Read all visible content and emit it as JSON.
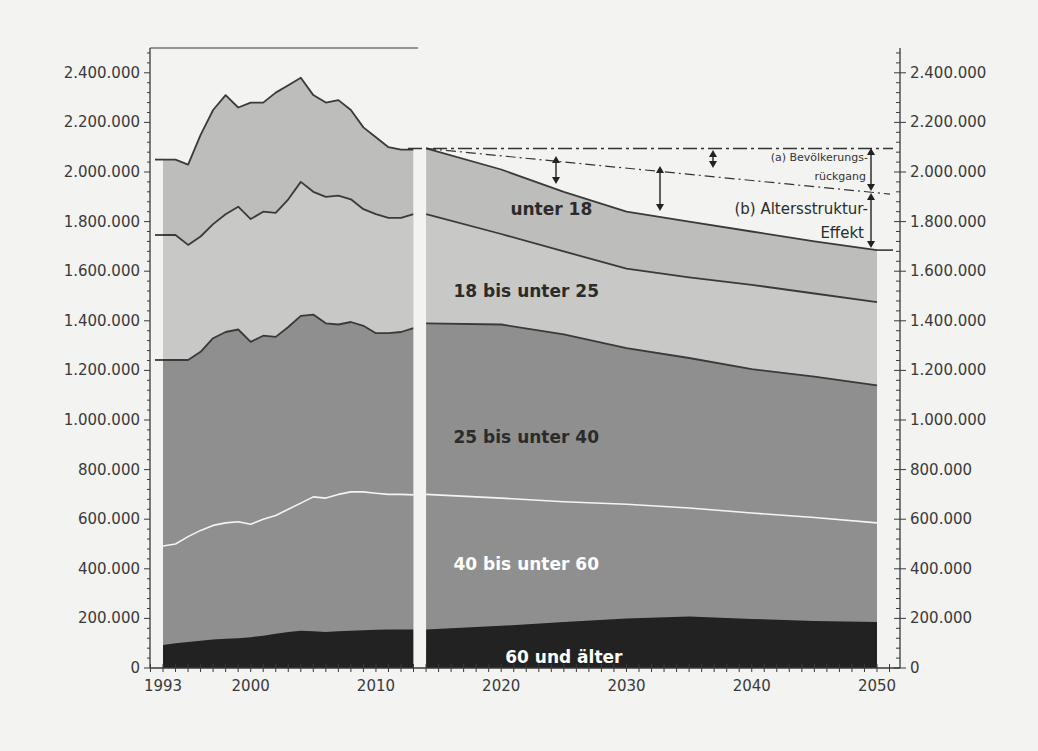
{
  "chart_data": {
    "type": "area",
    "stacked": true,
    "title": "",
    "xlabel": "",
    "ylabel": "",
    "ylim": [
      0,
      2500000
    ],
    "y_ticks": [
      "0",
      "200.000",
      "400.000",
      "600.000",
      "800.000",
      "1.000.000",
      "1.200.000",
      "1.400.000",
      "1.600.000",
      "1.800.000",
      "2.000.000",
      "2.200.000",
      "2.400.000"
    ],
    "y_tick_values": [
      0,
      200000,
      400000,
      600000,
      800000,
      1000000,
      1200000,
      1400000,
      1600000,
      1800000,
      2000000,
      2200000,
      2400000
    ],
    "x_ticks": [
      "1993",
      "2000",
      "2010",
      "2020",
      "2030",
      "2040",
      "2050"
    ],
    "x_tick_values": [
      1993,
      2000,
      2010,
      2020,
      2030,
      2040,
      2050
    ],
    "gap_between": [
      2013,
      2014
    ],
    "grid": false,
    "dual_y_axis": true,
    "series_cumulative_tops": {
      "historical": {
        "x": [
          1993,
          1994,
          1995,
          1996,
          1997,
          1998,
          1999,
          2000,
          2001,
          2002,
          2003,
          2004,
          2005,
          2006,
          2007,
          2008,
          2009,
          2010,
          2011,
          2012,
          2013
        ],
        "total": [
          2050000,
          2050000,
          2030000,
          2150000,
          2250000,
          2310000,
          2260000,
          2280000,
          2280000,
          2320000,
          2350000,
          2380000,
          2310000,
          2280000,
          2290000,
          2250000,
          2180000,
          2140000,
          2100000,
          2090000,
          2090000
        ],
        "age18plus": [
          1746000,
          1746000,
          1706000,
          1740000,
          1790000,
          1830000,
          1860000,
          1810000,
          1840000,
          1835000,
          1890000,
          1960000,
          1920000,
          1900000,
          1905000,
          1890000,
          1850000,
          1830000,
          1815000,
          1815000,
          1830000
        ],
        "age25plus": [
          1242000,
          1242000,
          1242000,
          1275000,
          1330000,
          1355000,
          1365000,
          1315000,
          1340000,
          1335000,
          1375000,
          1420000,
          1425000,
          1390000,
          1385000,
          1395000,
          1380000,
          1350000,
          1350000,
          1355000,
          1370000
        ],
        "age40plus": [
          492000,
          500000,
          530000,
          555000,
          575000,
          585000,
          590000,
          580000,
          600000,
          615000,
          640000,
          665000,
          690000,
          685000,
          700000,
          710000,
          710000,
          705000,
          700000,
          700000,
          698000
        ],
        "age60plus": [
          93000,
          100000,
          105000,
          110000,
          115000,
          118000,
          120000,
          124000,
          130000,
          138000,
          145000,
          150000,
          148000,
          145000,
          148000,
          150000,
          152000,
          154000,
          155000,
          155000,
          155000
        ]
      },
      "projection": {
        "x": [
          2014,
          2020,
          2025,
          2030,
          2035,
          2040,
          2045,
          2050
        ],
        "total": [
          2095000,
          2010000,
          1920000,
          1840000,
          1800000,
          1760000,
          1720000,
          1685000
        ],
        "age18plus": [
          1830000,
          1750000,
          1680000,
          1610000,
          1575000,
          1545000,
          1510000,
          1475000
        ],
        "age25plus": [
          1390000,
          1385000,
          1345000,
          1290000,
          1250000,
          1205000,
          1175000,
          1140000
        ],
        "age40plus": [
          700000,
          685000,
          670000,
          660000,
          645000,
          625000,
          607000,
          585000
        ],
        "age60plus": [
          155000,
          170000,
          185000,
          200000,
          208000,
          198000,
          190000,
          185000
        ]
      }
    },
    "series": [
      {
        "name": "60 und älter",
        "color": "#222222"
      },
      {
        "name": "40 bis unter 60",
        "color": "#8f8f8f"
      },
      {
        "name": "25 bis unter 40",
        "color": "#8f8f8f"
      },
      {
        "name": "18 bis unter 25",
        "color": "#c8c8c6"
      },
      {
        "name": "unter 18",
        "color": "#bdbdbb"
      }
    ],
    "reference_lines": {
      "constant_level": 2095000,
      "population_decline_path": {
        "x": [
          2014,
          2050
        ],
        "y": [
          2095000,
          1915000
        ]
      }
    },
    "annotations": [
      {
        "id": "a",
        "text_line1": "(a) Bevölkerungs-",
        "text_line2": "rückgang"
      },
      {
        "id": "b",
        "text_line1": "(b) Altersstruktur-",
        "text_line2": "Effekt"
      }
    ],
    "band_labels": [
      {
        "text": "unter 18",
        "x": 2024,
        "y": 1850000,
        "white": false
      },
      {
        "text": "18 bis unter 25",
        "x": 2022,
        "y": 1520000,
        "white": false
      },
      {
        "text": "25 bis unter 40",
        "x": 2022,
        "y": 930000,
        "white": false
      },
      {
        "text": "40 bis unter 60",
        "x": 2022,
        "y": 420000,
        "white": true
      },
      {
        "text": "60 und älter",
        "x": 2025,
        "y": 45000,
        "white": true
      }
    ]
  },
  "colors": {
    "background": "#f3f3f1",
    "axis": "#3a3a3a",
    "gap": "#f3f3f1",
    "line_dark": "#3a3a3a",
    "line_white": "#f4f4f4"
  }
}
